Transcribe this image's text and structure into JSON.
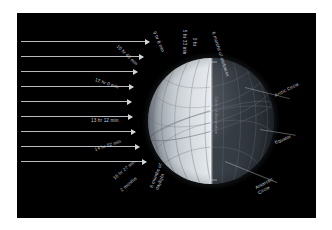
{
  "figure": {
    "background_color": "#ffffff",
    "panel_color": "#000000",
    "ray_color": "#b9bcbd",
    "label_color": "#c8cccf"
  },
  "sun_rays": {
    "name": "incoming-sunlight",
    "count": 9,
    "direction": "left-to-right"
  },
  "globe": {
    "lit_side": "left",
    "dark_side": "right",
    "terminator_label": "Circle of illumination",
    "grid": "latitude-longitude graticule"
  },
  "daylight_labels": [
    {
      "text": "6 months of darkness",
      "side": "top-right"
    },
    {
      "text": "0 hr",
      "side": "top"
    },
    {
      "text": "5 hr 33 min",
      "side": "top"
    },
    {
      "text": "9 hr 8 min",
      "side": "top-left"
    },
    {
      "text": "10 hr 48 min",
      "side": "top-left"
    },
    {
      "text": "12 hr 0 min",
      "side": "left"
    },
    {
      "text": "13 hr 12 min",
      "side": "left"
    },
    {
      "text": "14 hr 52 min",
      "side": "lower-left"
    },
    {
      "text": "18 hr 27 min",
      "side": "lower-left"
    },
    {
      "text": "2 months",
      "side": "lower-left"
    },
    {
      "text": "6 months of daylight",
      "side": "bottom"
    }
  ],
  "circle_labels": [
    {
      "text": "Arctic Circle",
      "side": "right-upper"
    },
    {
      "text": "Equator",
      "side": "right-middle"
    },
    {
      "text": "Antarctic",
      "text2": "Circle",
      "side": "right-lower"
    }
  ]
}
